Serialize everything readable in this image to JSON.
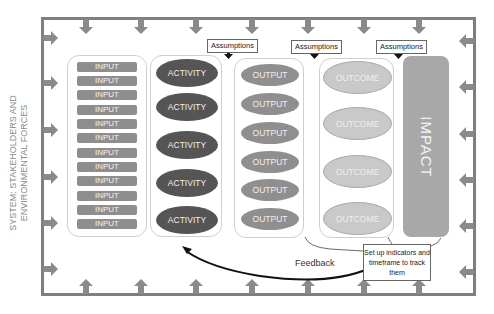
{
  "side_label": "SYSTEM: STAKEHOLDERS AND ENVIRONMENTAL FORCES",
  "columns": {
    "inputs": [
      "INPUT",
      "INPUT",
      "INPUT",
      "INPUT",
      "INPUT",
      "INPUT",
      "INPUT",
      "INPUT",
      "INPUT",
      "INPUT",
      "INPUT",
      "INPUT"
    ],
    "activities": [
      "ACTIVITY",
      "ACTIVITY",
      "ACTIVITY",
      "ACTIVITY",
      "ACTIVITY"
    ],
    "outputs": [
      "OUTPUT",
      "OUTPUT",
      "OUTPUT",
      "OUTPUT",
      "OUTPUT",
      "OUTPUT"
    ],
    "outcomes": [
      "OUTCOME",
      "OUTCOME",
      "OUTCOME",
      "OUTCOME"
    ],
    "impact": "IMPACT"
  },
  "assumptions": [
    "Assumptions",
    "Assumptions",
    "Assumptions"
  ],
  "note": "Set up indicators and timeframe to track them",
  "feedback_label": "Feedback",
  "colors": {
    "frame": "#7f7f7f",
    "input": "#8e8e8e",
    "activity": "#555555",
    "output": "#8f8f8f",
    "outcome": "#c9c9c9",
    "impact": "#a8a8a8",
    "arrow": "#8a8a8a"
  }
}
